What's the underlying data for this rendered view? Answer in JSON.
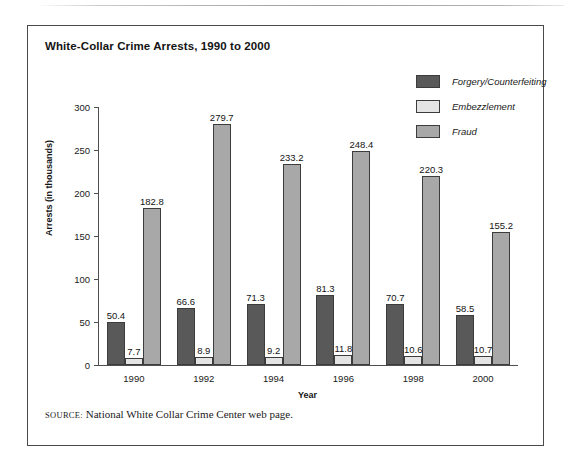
{
  "figure": {
    "title": "White-Collar Crime Arrests, 1990 to 2000",
    "source_caps": "SOURCE:",
    "source_text": " National White Collar Crime Center web page."
  },
  "chart_data": {
    "type": "bar",
    "title": "White-Collar Crime Arrests, 1990 to 2000",
    "xlabel": "Year",
    "ylabel": "Arrests (in thousands)",
    "ylim": [
      0,
      300
    ],
    "yticks": [
      0,
      50,
      100,
      150,
      200,
      250,
      300
    ],
    "grid": false,
    "legend_position": "top-right",
    "categories": [
      "1990",
      "1992",
      "1994",
      "1996",
      "1998",
      "2000"
    ],
    "series": [
      {
        "name": "Forgery/Counterfeiting",
        "color": "#595959",
        "values": [
          50.4,
          66.6,
          71.3,
          81.3,
          70.7,
          58.5
        ]
      },
      {
        "name": "Embezzlement",
        "color": "#e4e4e4",
        "values": [
          7.7,
          8.9,
          9.2,
          11.8,
          10.6,
          10.7
        ]
      },
      {
        "name": "Fraud",
        "color": "#a8a8a8",
        "values": [
          182.8,
          279.7,
          233.2,
          248.4,
          220.3,
          155.2
        ]
      }
    ]
  }
}
